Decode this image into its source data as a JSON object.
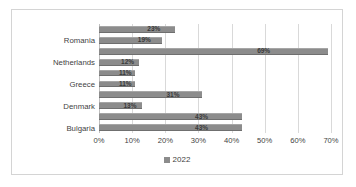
{
  "chart_data": {
    "type": "bar",
    "orientation": "horizontal",
    "title": "",
    "xlabel": "",
    "ylabel": "",
    "xlim": [
      0,
      70
    ],
    "grid": true,
    "legend_position": "bottom",
    "categories": [
      "",
      "Romania",
      "",
      "Netherlands",
      "",
      "Greece",
      "",
      "Denmark",
      "",
      "Bulgaria"
    ],
    "visible_category_labels": [
      "Romania",
      "Netherlands",
      "Greece",
      "Denmark",
      "Bulgaria"
    ],
    "values": [
      23,
      19,
      69,
      12,
      11,
      11,
      31,
      13,
      43,
      43
    ],
    "data_labels": [
      "23%",
      "19%",
      "69%",
      "12%",
      "11%",
      "11%",
      "31%",
      "13%",
      "43%",
      "43%"
    ],
    "xticks": [
      0,
      10,
      20,
      30,
      40,
      50,
      60,
      70
    ],
    "xtick_labels": [
      "0%",
      "10%",
      "20%",
      "30%",
      "40%",
      "50%",
      "60%",
      "70%"
    ],
    "series": [
      {
        "name": "2022",
        "color": "#8c8c8c",
        "values": [
          23,
          19,
          69,
          12,
          11,
          11,
          31,
          13,
          43,
          43
        ]
      }
    ],
    "legend": [
      "2022"
    ]
  },
  "colors": {
    "bar": "#8c8c8c",
    "gridline": "#d9d9d9",
    "frame_border": "#d4d4d4",
    "text": "#3f3f3f",
    "data_label": "#3a3a3a",
    "background": "#ffffff"
  }
}
